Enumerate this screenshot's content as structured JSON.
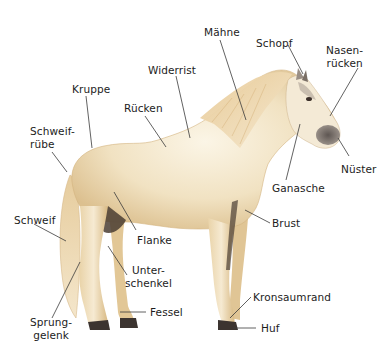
{
  "diagram": {
    "colors": {
      "coat": "#efe0bf",
      "coat_light": "#f8f0dd",
      "coat_shadow": "#d9b985",
      "mane": "#e6c896",
      "muzzle": "#7a716b",
      "hoof": "#3c3430",
      "leader_line": "#3a3a3a",
      "label_text": "#1c1c1c"
    },
    "labels": [
      {
        "id": "maehne",
        "text": "Mähne"
      },
      {
        "id": "schopf",
        "text": "Schopf"
      },
      {
        "id": "nasenruecken",
        "text": "Nasen-\nrücken"
      },
      {
        "id": "widerrist",
        "text": "Widerrist"
      },
      {
        "id": "kruppe",
        "text": "Kruppe"
      },
      {
        "id": "ruecken",
        "text": "Rücken"
      },
      {
        "id": "schweifruebe",
        "text": "Schweif-\nrübe"
      },
      {
        "id": "nuester",
        "text": "Nüster"
      },
      {
        "id": "ganasche",
        "text": "Ganasche"
      },
      {
        "id": "brust",
        "text": "Brust"
      },
      {
        "id": "schweif",
        "text": "Schweif"
      },
      {
        "id": "flanke",
        "text": "Flanke"
      },
      {
        "id": "unterschenkel",
        "text": "Unter-\nschenkel"
      },
      {
        "id": "kronsaumrand",
        "text": "Kronsaumrand"
      },
      {
        "id": "fessel",
        "text": "Fessel"
      },
      {
        "id": "huf",
        "text": "Huf"
      },
      {
        "id": "sprunggelenk",
        "text": "Sprung-\ngelenk"
      }
    ]
  }
}
